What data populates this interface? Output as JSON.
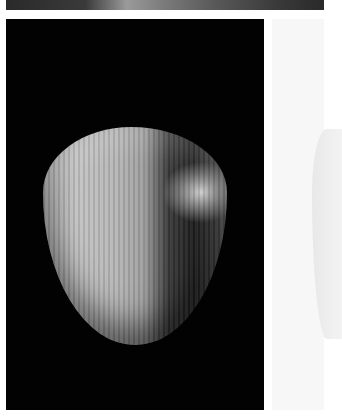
{
  "image": {
    "description": "Grayscale photograph of a rounded wooden knob-like object with visible vertical wood grain on a black background, with a faded duplicate panel at right",
    "subject": "wooden rounded object",
    "colors": {
      "background": "#020202",
      "page": "#ffffff",
      "side_panel": "#f7f7f7"
    }
  }
}
